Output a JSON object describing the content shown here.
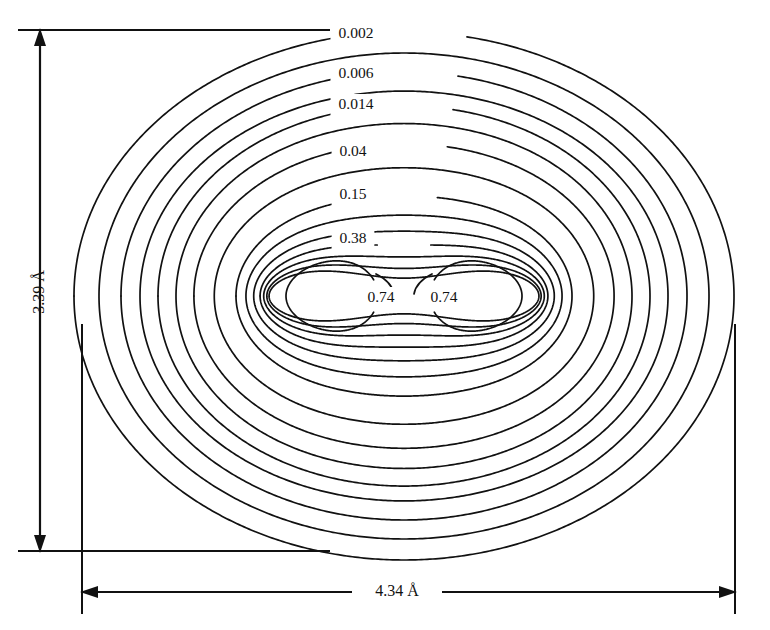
{
  "figure": {
    "background_color": "#ffffff",
    "line_color": "#111111"
  },
  "dimensions": {
    "vertical": {
      "label": "3.39 Å",
      "name": "vertical-dimension"
    },
    "horizontal": {
      "label": "4.34 Å",
      "name": "horizontal-dimension"
    }
  },
  "contour_labels": [
    {
      "text": "0.002",
      "x": 356,
      "y": 34
    },
    {
      "text": "0.006",
      "x": 356,
      "y": 74
    },
    {
      "text": "0.014",
      "x": 356,
      "y": 105
    },
    {
      "text": "0.04",
      "x": 353,
      "y": 152
    },
    {
      "text": "0.15",
      "x": 353,
      "y": 195
    },
    {
      "text": "0.38",
      "x": 353,
      "y": 239
    },
    {
      "text": "0.74",
      "x": 381,
      "y": 298
    },
    {
      "text": "0.74",
      "x": 444,
      "y": 298
    }
  ],
  "chart_data": {
    "type": "contour",
    "xlabel": "4.34 Å",
    "ylabel": "3.39 Å",
    "units": "electrons per cubic ångström",
    "grid": false,
    "legend": "none",
    "labeled_levels": [
      0.002,
      0.006,
      0.014,
      0.04,
      0.15,
      0.38,
      0.74
    ],
    "label_texts": [
      "0.002",
      "0.006",
      "0.014",
      "0.04",
      "0.15",
      "0.38",
      "0.74",
      "0.74"
    ],
    "total_contours": 15,
    "extent": {
      "width_angstrom": 4.34,
      "height_angstrom": 3.39
    },
    "nuclei": [
      {
        "index": 1,
        "cx": 332,
        "cy": 296
      },
      {
        "index": 2,
        "cx": 476,
        "cy": 296
      }
    ],
    "contours": [
      {
        "level": 0.002,
        "rx": 330,
        "ry": 264,
        "waist": 0.0,
        "lobe": 0.0,
        "labeled": true,
        "label_gap": 0.06,
        "label_y": 34
      },
      {
        "level": 0.004,
        "rx": 305,
        "ry": 243,
        "waist": 0.0,
        "lobe": 0.0,
        "labeled": false,
        "label_gap": 0.0
      },
      {
        "level": 0.006,
        "rx": 283,
        "ry": 224,
        "waist": 0.0,
        "lobe": 0.0,
        "labeled": true,
        "label_gap": 0.06,
        "label_y": 74
      },
      {
        "level": 0.009,
        "rx": 264,
        "ry": 207,
        "waist": 0.01,
        "lobe": 0.0,
        "labeled": false,
        "label_gap": 0.0
      },
      {
        "level": 0.014,
        "rx": 246,
        "ry": 192,
        "waist": 0.01,
        "lobe": 0.0,
        "labeled": true,
        "label_gap": 0.062,
        "label_y": 105
      },
      {
        "level": 0.022,
        "rx": 228,
        "ry": 176,
        "waist": 0.02,
        "lobe": 0.0,
        "labeled": false,
        "label_gap": 0.0
      },
      {
        "level": 0.04,
        "rx": 208,
        "ry": 157,
        "waist": 0.03,
        "lobe": 0.01,
        "labeled": true,
        "label_gap": 0.064,
        "label_y": 152
      },
      {
        "level": 0.07,
        "rx": 186,
        "ry": 135,
        "waist": 0.05,
        "lobe": 0.02,
        "labeled": false,
        "label_gap": 0.0
      },
      {
        "level": 0.15,
        "rx": 160,
        "ry": 110,
        "waist": 0.09,
        "lobe": 0.05,
        "labeled": true,
        "label_gap": 0.066,
        "label_y": 195
      },
      {
        "level": 0.22,
        "rx": 145,
        "ry": 94,
        "waist": 0.14,
        "lobe": 0.09,
        "labeled": false,
        "label_gap": 0.0
      },
      {
        "level": 0.3,
        "rx": 133,
        "ry": 81,
        "waist": 0.2,
        "lobe": 0.13,
        "labeled": false,
        "label_gap": 0.0
      },
      {
        "level": 0.38,
        "rx": 123,
        "ry": 70,
        "waist": 0.27,
        "lobe": 0.17,
        "labeled": true,
        "label_gap": 0.068,
        "label_y": 239
      },
      {
        "level": 0.48,
        "rx": 115,
        "ry": 61,
        "waist": 0.36,
        "lobe": 0.22,
        "labeled": false,
        "label_gap": 0.0
      },
      {
        "level": 0.58,
        "rx": 108,
        "ry": 53,
        "waist": 0.48,
        "lobe": 0.27,
        "labeled": false,
        "label_gap": 0.0
      },
      {
        "level": 0.66,
        "rx": 103,
        "ry": 47,
        "waist": 0.62,
        "lobe": 0.31,
        "labeled": false,
        "label_gap": 0.0
      }
    ],
    "lobes": [
      {
        "level": 0.74,
        "cx": 332,
        "cy": 296,
        "rx": 46,
        "ry": 35,
        "side": "left"
      },
      {
        "level": 0.74,
        "cx": 476,
        "cy": 296,
        "rx": 46,
        "ry": 35,
        "side": "right"
      }
    ]
  }
}
